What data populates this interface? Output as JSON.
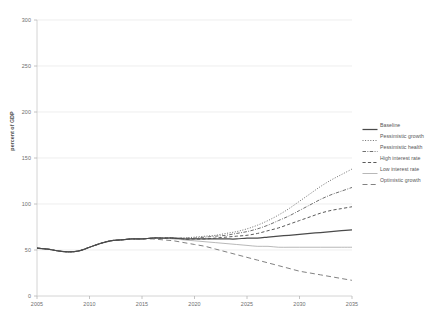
{
  "chart_data": {
    "type": "line",
    "title": "",
    "subtitle": "",
    "xlabel": "",
    "ylabel": "percent of GDP",
    "xlim": [
      2005,
      2035
    ],
    "ylim": [
      0,
      300
    ],
    "grid": true,
    "legend_position": "right",
    "x_ticks": [
      "2005",
      "2010",
      "2015",
      "2020",
      "2025",
      "2030",
      "2035"
    ],
    "y_ticks": [
      "0",
      "50",
      "100",
      "150",
      "200",
      "250",
      "300"
    ],
    "x": [
      2005,
      2006,
      2007,
      2008,
      2009,
      2010,
      2011,
      2012,
      2013,
      2014,
      2015,
      2016,
      2017,
      2018,
      2019,
      2020,
      2021,
      2022,
      2023,
      2024,
      2025,
      2026,
      2027,
      2028,
      2029,
      2030,
      2031,
      2032,
      2033,
      2034,
      2035
    ],
    "series": [
      {
        "name": "Baseline",
        "style": "solid",
        "color": "#4a4a4a",
        "values": [
          52,
          51,
          49,
          48,
          49,
          53,
          57,
          60,
          61,
          62,
          62,
          63,
          63,
          63,
          62,
          62,
          62,
          62,
          62,
          62,
          63,
          63,
          64,
          65,
          66,
          67,
          68,
          69,
          70,
          71,
          72
        ]
      },
      {
        "name": "Pessimistic growth",
        "style": "dotted",
        "color": "#6f6f6f",
        "values": [
          52,
          51,
          49,
          48,
          49,
          53,
          57,
          60,
          61,
          62,
          62,
          63,
          63,
          63,
          63,
          64,
          65,
          66,
          68,
          70,
          73,
          77,
          82,
          88,
          95,
          103,
          111,
          119,
          126,
          132,
          138
        ]
      },
      {
        "name": "Pessimistic health",
        "style": "dash-dot",
        "color": "#707070",
        "values": [
          52,
          51,
          49,
          48,
          49,
          53,
          57,
          60,
          61,
          62,
          62,
          63,
          63,
          63,
          63,
          63,
          64,
          65,
          66,
          68,
          70,
          73,
          77,
          82,
          87,
          93,
          99,
          105,
          110,
          114,
          118
        ]
      },
      {
        "name": "High interest rate",
        "style": "dashed",
        "color": "#5a5a5a",
        "values": [
          52,
          51,
          49,
          48,
          49,
          53,
          57,
          60,
          61,
          62,
          62,
          63,
          63,
          63,
          62,
          62,
          62,
          63,
          64,
          65,
          66,
          68,
          71,
          74,
          78,
          82,
          86,
          90,
          93,
          95,
          97
        ]
      },
      {
        "name": "Low interest rate",
        "style": "solid-thin",
        "color": "#9a9a9a",
        "values": [
          52,
          51,
          49,
          48,
          49,
          53,
          57,
          60,
          61,
          62,
          62,
          63,
          63,
          62,
          61,
          60,
          59,
          58,
          57,
          56,
          55,
          54,
          54,
          53,
          53,
          53,
          53,
          53,
          53,
          53,
          53
        ]
      },
      {
        "name": "Optimistic growth",
        "style": "long-dash",
        "color": "#828282",
        "values": [
          52,
          51,
          49,
          48,
          49,
          53,
          57,
          60,
          61,
          62,
          62,
          62,
          61,
          60,
          58,
          56,
          54,
          51,
          48,
          45,
          42,
          39,
          36,
          33,
          30,
          27,
          25,
          23,
          21,
          19,
          17
        ]
      }
    ]
  },
  "axes": {
    "y_title": "percent of GDP"
  },
  "legend": {
    "entries": [
      {
        "label": "Baseline"
      },
      {
        "label": "Pessimistic growth"
      },
      {
        "label": "Pessimistic health"
      },
      {
        "label": "High interest rate"
      },
      {
        "label": "Low interest rate"
      },
      {
        "label": "Optimistic growth"
      }
    ]
  }
}
